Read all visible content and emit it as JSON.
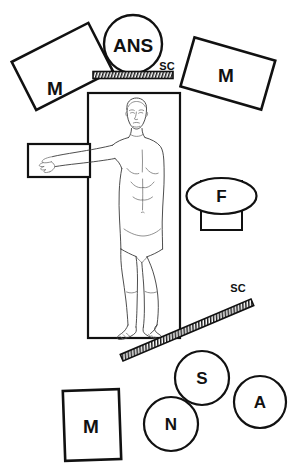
{
  "figure": {
    "background_color": "#ffffff",
    "stroke_color": "#111111",
    "body_stroke_color": "#3a3a3a"
  },
  "labels": {
    "magnet_left": "M",
    "magnet_right": "M",
    "magnet_bottom": "M",
    "ans": "ANS",
    "sc_top": "SC",
    "sc_diagonal": "SC",
    "f": "F",
    "s": "S",
    "n": "N",
    "a": "A"
  },
  "elements": [
    {
      "id": "magnet-left",
      "name": "magnet-left-rect",
      "shape": "rect",
      "label": "M",
      "rotation_deg": -27
    },
    {
      "id": "magnet-right",
      "name": "magnet-right-rect",
      "shape": "rect",
      "label": "M",
      "rotation_deg": 16
    },
    {
      "id": "magnet-bottom",
      "name": "magnet-bottom-rect",
      "shape": "rect",
      "label": "M",
      "rotation_deg": -2
    },
    {
      "id": "ans-circle",
      "name": "ans-circle",
      "shape": "circle",
      "label": "ANS",
      "rotation_deg": 0
    },
    {
      "id": "sc-bar-top",
      "name": "sc-bar-horizontal",
      "shape": "hatched-bar",
      "label": "SC",
      "rotation_deg": 0
    },
    {
      "id": "sc-bar-diagonal",
      "name": "sc-bar-diagonal",
      "shape": "hatched-bar",
      "label": "SC",
      "rotation_deg": -23
    },
    {
      "id": "f-group",
      "name": "f-ellipse-with-rect",
      "shape": "ellipse",
      "label": "F",
      "rotation_deg": 0
    },
    {
      "id": "s-circle",
      "name": "s-circle",
      "shape": "circle",
      "label": "S",
      "rotation_deg": 0
    },
    {
      "id": "n-circle",
      "name": "n-circle",
      "shape": "circle",
      "label": "N",
      "rotation_deg": 0
    },
    {
      "id": "a-circle",
      "name": "a-circle",
      "shape": "circle",
      "label": "A",
      "rotation_deg": 0
    },
    {
      "id": "body-frame",
      "name": "body-frame-rect",
      "shape": "rect",
      "label": "",
      "rotation_deg": 0
    },
    {
      "id": "arm-box",
      "name": "extended-arm-rect",
      "shape": "rect",
      "label": "",
      "rotation_deg": 0
    },
    {
      "id": "human-figure",
      "name": "human-body-figure",
      "shape": "outline",
      "label": "",
      "rotation_deg": 0
    }
  ]
}
